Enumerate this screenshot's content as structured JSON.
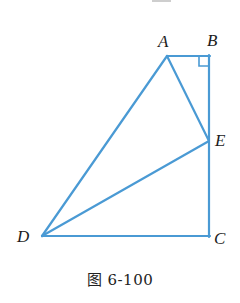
{
  "figure": {
    "caption": "图 6-100",
    "stroke_color": "#4a9ad4",
    "label_color": "#1c1c1c",
    "background": "#ffffff",
    "stroke_width": 2.2,
    "vertices": [
      {
        "name": "A",
        "label": "A",
        "x": 167,
        "y": 56
      },
      {
        "name": "B",
        "label": "B",
        "x": 209,
        "y": 56
      },
      {
        "name": "C",
        "label": "C",
        "x": 209,
        "y": 236
      },
      {
        "name": "D",
        "label": "D",
        "x": 42,
        "y": 236
      },
      {
        "name": "E",
        "label": "E",
        "x": 209,
        "y": 141
      }
    ],
    "segments": [
      {
        "name": "segment-AB",
        "from": "A",
        "to": "B"
      },
      {
        "name": "segment-BC",
        "from": "B",
        "to": "C"
      },
      {
        "name": "segment-CD",
        "from": "C",
        "to": "D"
      },
      {
        "name": "segment-DA",
        "from": "D",
        "to": "A"
      },
      {
        "name": "segment-AE",
        "from": "A",
        "to": "E"
      },
      {
        "name": "segment-DE",
        "from": "D",
        "to": "E"
      }
    ],
    "right_angle_marker": {
      "at": "B",
      "size": 9
    }
  }
}
